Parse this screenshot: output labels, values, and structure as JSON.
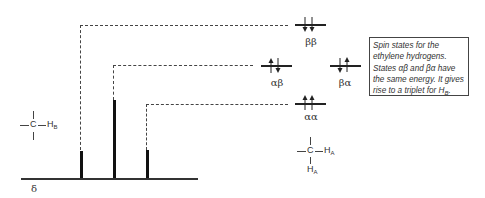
{
  "axis": {
    "label": "δ"
  },
  "spectrum": {
    "type": "triplet",
    "peaks": [
      {
        "name": "left",
        "relative_height": 1
      },
      {
        "name": "center",
        "relative_height": 2
      },
      {
        "name": "right",
        "relative_height": 1
      }
    ]
  },
  "energy_levels": [
    {
      "label": "ββ",
      "spins": [
        "down",
        "down"
      ]
    },
    {
      "label": "αβ",
      "spins": [
        "up",
        "down"
      ]
    },
    {
      "label": "βα",
      "spins": [
        "down",
        "up"
      ]
    },
    {
      "label": "αα",
      "spins": [
        "up",
        "up"
      ]
    }
  ],
  "fragments": {
    "hb": {
      "center": "C",
      "sub_label": "H",
      "sub_index": "B"
    },
    "ha": {
      "center": "C",
      "right_label": "H",
      "right_index": "A",
      "bottom_label": "H",
      "bottom_index": "A"
    }
  },
  "note": {
    "text_main": "Spin states for the ethylene hydrogens. States αβ and βα have the same energy. It gives rise to a triplet for H",
    "text_sub": "B",
    "text_end": "."
  }
}
